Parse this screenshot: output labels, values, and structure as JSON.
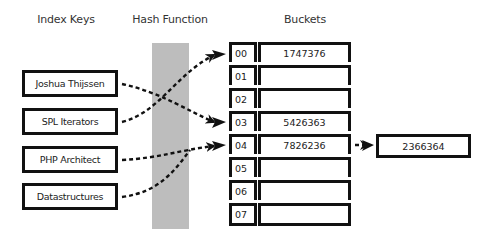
{
  "headers": {
    "index_keys": "Index Keys",
    "hash_function": "Hash Function",
    "buckets": "Buckets"
  },
  "keys": [
    {
      "label": "Joshua Thijssen",
      "bucket": "03"
    },
    {
      "label": "SPL Iterators",
      "bucket": "00"
    },
    {
      "label": "PHP Architect",
      "bucket": "04"
    },
    {
      "label": "Datastructures",
      "bucket": "04"
    }
  ],
  "buckets": [
    {
      "index": "00",
      "value": "1747376"
    },
    {
      "index": "01",
      "value": ""
    },
    {
      "index": "02",
      "value": ""
    },
    {
      "index": "03",
      "value": "5426363"
    },
    {
      "index": "04",
      "value": "7826236"
    },
    {
      "index": "05",
      "value": ""
    },
    {
      "index": "06",
      "value": ""
    },
    {
      "index": "07",
      "value": ""
    }
  ],
  "overflow": {
    "from_index": "04",
    "value": "2366364"
  },
  "colors": {
    "line": "#111111",
    "hash_bar": "#bdbdbd",
    "background": "#ffffff"
  }
}
